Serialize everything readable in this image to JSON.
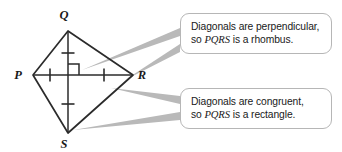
{
  "figure": {
    "shape_name": "PQRS",
    "vertices": [
      {
        "label": "P",
        "x": 33,
        "y": 75,
        "label_x": 18,
        "label_y": 79
      },
      {
        "label": "Q",
        "x": 68,
        "y": 31,
        "label_x": 64,
        "label_y": 19
      },
      {
        "label": "R",
        "x": 133,
        "y": 75,
        "label_x": 140,
        "label_y": 79
      },
      {
        "label": "S",
        "x": 68,
        "y": 133,
        "label_x": 64,
        "label_y": 147
      }
    ],
    "diagonals": [
      {
        "name": "PR",
        "x1": 33,
        "y1": 75,
        "x2": 133,
        "y2": 75
      },
      {
        "name": "QS",
        "x1": 68,
        "y1": 31,
        "x2": 68,
        "y2": 133
      }
    ],
    "tick_marks": [
      {
        "name": "tick-diagonal-qo",
        "cx": 68,
        "cy": 53,
        "orientation": "horizontal"
      },
      {
        "name": "tick-diagonal-os",
        "cx": 68,
        "cy": 104,
        "orientation": "horizontal"
      },
      {
        "name": "tick-diagonal-po",
        "cx": 50,
        "cy": 75,
        "orientation": "vertical"
      },
      {
        "name": "tick-diagonal-or",
        "cx": 104,
        "cy": 75,
        "orientation": "vertical"
      }
    ],
    "right_angle_marker": {
      "x": 68,
      "y": 75,
      "size": 11
    },
    "outline_color": "#2b2b2b",
    "leader_color": "#b0b0b0"
  },
  "callouts": [
    {
      "id": "rhombus",
      "line1": "Diagonals are perpendicular,",
      "line2_prefix": "so ",
      "line2_math": "PQRS",
      "line2_suffix": " is a rhombus.",
      "leaders": [
        {
          "tip_x": 82,
          "tip_y": 70,
          "base_top_x": 180,
          "base_top_y": 28,
          "base_bottom_x": 180,
          "base_bottom_y": 36
        },
        {
          "tip_x": 125,
          "tip_y": 80,
          "base_top_x": 180,
          "base_top_y": 44,
          "base_bottom_x": 180,
          "base_bottom_y": 52
        }
      ]
    },
    {
      "id": "rectangle",
      "line1": "Diagonals are congruent,",
      "line2_prefix": "so ",
      "line2_math": "PQRS",
      "line2_suffix": " is a rectangle.",
      "leaders": [
        {
          "tip_x": 111,
          "tip_y": 88,
          "base_top_x": 180,
          "base_top_y": 96,
          "base_bottom_x": 180,
          "base_bottom_y": 104
        },
        {
          "tip_x": 73,
          "tip_y": 130,
          "base_top_x": 180,
          "base_top_y": 112,
          "base_bottom_x": 180,
          "base_bottom_y": 120
        }
      ]
    }
  ]
}
